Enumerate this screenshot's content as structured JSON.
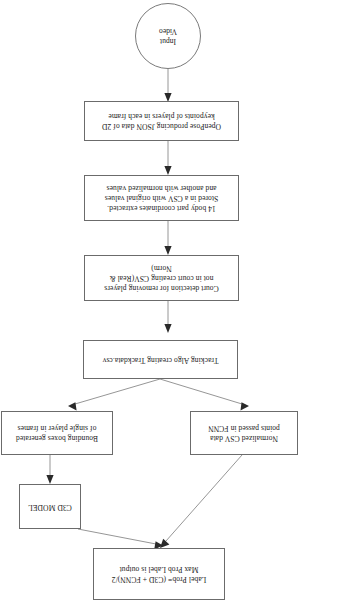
{
  "diagram": {
    "orientation": "rotated-180",
    "background_color": "#ffffff",
    "node_border_color": "#6b6b6b",
    "edge_color": "#8a8a8a",
    "nodes": [
      {
        "id": "input-video",
        "shape": "ellipse",
        "label": "Input\nVideo"
      },
      {
        "id": "openpose",
        "shape": "rect",
        "label": "OpenPose producing JSON data of 2D\nkeypoints of players in each frame"
      },
      {
        "id": "body-part-coordinates",
        "shape": "rect",
        "label": "14 body part coordinates extracted.\nStored in a CSV with original values\nand another with normalized values"
      },
      {
        "id": "court-detection",
        "shape": "rect",
        "label": "Court detection for removing players\nnot in court creating CSV(Real &\nNorm)"
      },
      {
        "id": "tracking-algo",
        "shape": "rect",
        "label": "Tracking Algo creating Trackdata.csv"
      },
      {
        "id": "normalized-fcnn",
        "shape": "rect",
        "label": "Normalized CSV data\npoints passed in FCNN"
      },
      {
        "id": "bounding-boxes",
        "shape": "rect",
        "label": "Bounding boxes generated\nof single player in frames"
      },
      {
        "id": "c3d-model",
        "shape": "rect",
        "label": "C3D MODEL"
      },
      {
        "id": "label-fusion",
        "shape": "rect",
        "label": "Label Prob= (C3D + FCNN)/2\nMax Prob Label is output"
      }
    ],
    "edges": [
      {
        "from": "input-video",
        "to": "openpose",
        "type": "arrow"
      },
      {
        "from": "openpose",
        "to": "body-part-coordinates",
        "type": "arrow"
      },
      {
        "from": "body-part-coordinates",
        "to": "court-detection",
        "type": "arrow"
      },
      {
        "from": "court-detection",
        "to": "tracking-algo",
        "type": "arrow"
      },
      {
        "from": "tracking-algo",
        "to": "normalized-fcnn",
        "type": "arrow"
      },
      {
        "from": "tracking-algo",
        "to": "bounding-boxes",
        "type": "arrow"
      },
      {
        "from": "bounding-boxes",
        "to": "c3d-model",
        "type": "arrow"
      },
      {
        "from": "normalized-fcnn",
        "to": "label-fusion",
        "type": "arrow"
      },
      {
        "from": "c3d-model",
        "to": "label-fusion",
        "type": "arrow"
      }
    ]
  }
}
